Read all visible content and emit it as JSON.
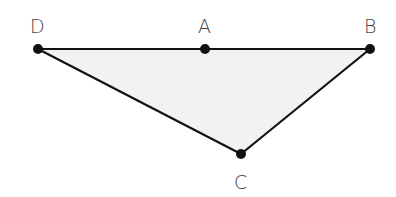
{
  "diagram": {
    "type": "triangle",
    "fill_color": "#f2f2f2",
    "stroke_color": "#111111",
    "points": {
      "D": {
        "label": "D",
        "x": 38,
        "y": 49
      },
      "A": {
        "label": "A",
        "x": 205,
        "y": 49
      },
      "B": {
        "label": "B",
        "x": 370,
        "y": 49
      },
      "C": {
        "label": "C",
        "x": 241,
        "y": 154
      }
    },
    "segments": [
      "DA",
      "AB",
      "BC",
      "CD"
    ]
  }
}
